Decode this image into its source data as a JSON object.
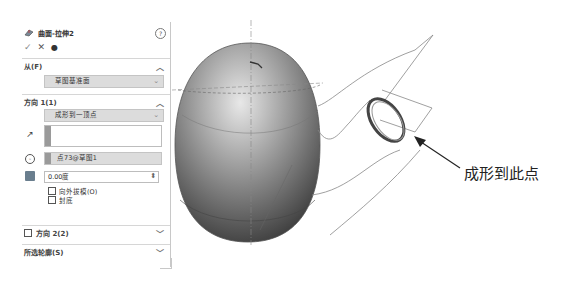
{
  "property_manager": {
    "title": "曲面-拉伸2",
    "title_icon": "surface-extrude-icon",
    "help_icon": "help-icon",
    "actions": {
      "ok": "✓",
      "cancel": "✕",
      "preview": "👁"
    },
    "from_section": {
      "label": "从(F)",
      "selected": "草图基准面"
    },
    "direction1_section": {
      "label": "方向 1(1)",
      "end_condition": "成形到一顶点",
      "direction_vector": "",
      "vertex": "点73@草图1",
      "draft_angle": "0.00度",
      "draft_outward_label": "向外拔模(O)",
      "cap_end_label": "封底"
    },
    "direction2_section": {
      "label": "方向 2(2)",
      "checked": false
    },
    "contours_section": {
      "label": "所选轮廓(S)"
    }
  },
  "viewport": {
    "callout_label": "成形到此点"
  }
}
